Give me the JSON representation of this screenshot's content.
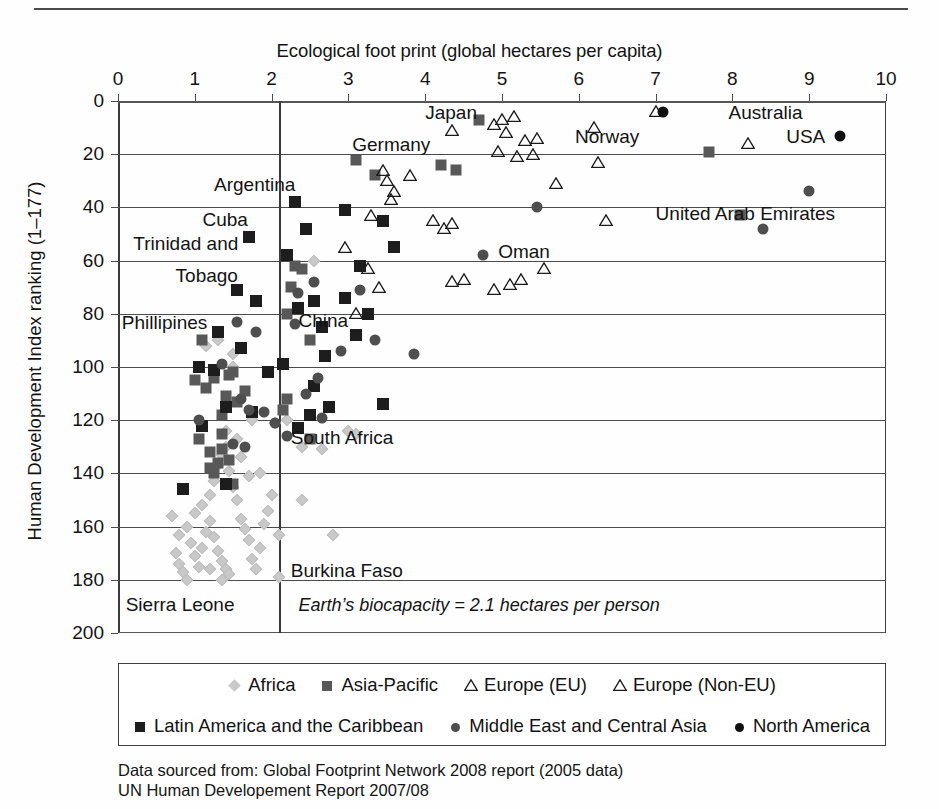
{
  "figure": {
    "top_rule": true,
    "source_lines": [
      "Data sourced from: Global Footprint Network 2008 report (2005 data)",
      "UN Human Developement Report 2007/08"
    ],
    "source_line_1": "Data sourced from: Global Footprint Network 2008 report (2005 data)",
    "source_line_2": "UN Human Developement Report 2007/08"
  },
  "chart_data": {
    "type": "scatter",
    "title": "",
    "xlabel": "Ecological foot print (global hectares per capita)",
    "ylabel": "Human Development Index ranking (1–177)",
    "xlim": [
      0,
      10
    ],
    "ylim": [
      0,
      200
    ],
    "xticks": [
      0,
      1,
      2,
      3,
      4,
      5,
      6,
      7,
      8,
      9,
      10
    ],
    "yticks": [
      0,
      20,
      40,
      60,
      80,
      100,
      120,
      140,
      160,
      180,
      200
    ],
    "y_inverted": true,
    "grid": "horizontal",
    "legend_position": "below-plot",
    "annotation_line": {
      "type": "vertical",
      "x": 2.1,
      "label": "Earth’s biocapacity = 2.1 hectares per person",
      "label_x": 2.35,
      "label_y": 190
    },
    "series": [
      {
        "name": "Africa",
        "marker": "diamond",
        "color": "#c9c9c9",
        "points": [
          [
            0.7,
            156
          ],
          [
            0.8,
            163
          ],
          [
            0.75,
            170
          ],
          [
            0.8,
            174
          ],
          [
            0.85,
            177
          ],
          [
            0.9,
            160
          ],
          [
            0.95,
            166
          ],
          [
            1.0,
            171
          ],
          [
            1.05,
            175
          ],
          [
            1.1,
            168
          ],
          [
            1.15,
            162
          ],
          [
            1.2,
            158
          ],
          [
            1.25,
            164
          ],
          [
            1.3,
            169
          ],
          [
            1.35,
            173
          ],
          [
            1.4,
            176
          ],
          [
            1.45,
            178
          ],
          [
            1.0,
            155
          ],
          [
            1.1,
            152
          ],
          [
            1.2,
            148
          ],
          [
            1.25,
            143
          ],
          [
            1.3,
            137
          ],
          [
            1.35,
            133
          ],
          [
            1.4,
            130
          ],
          [
            1.45,
            139
          ],
          [
            1.5,
            145
          ],
          [
            1.55,
            150
          ],
          [
            1.6,
            157
          ],
          [
            1.65,
            161
          ],
          [
            1.7,
            165
          ],
          [
            1.75,
            172
          ],
          [
            1.8,
            176
          ],
          [
            1.85,
            168
          ],
          [
            1.9,
            159
          ],
          [
            1.95,
            154
          ],
          [
            1.4,
            124
          ],
          [
            1.55,
            127
          ],
          [
            1.6,
            134
          ],
          [
            1.7,
            141
          ],
          [
            1.15,
            92
          ],
          [
            1.85,
            140
          ],
          [
            2.0,
            148
          ],
          [
            2.1,
            163
          ],
          [
            2.1,
            179
          ],
          [
            2.4,
            130
          ],
          [
            2.4,
            150
          ],
          [
            2.65,
            131
          ],
          [
            2.8,
            163
          ],
          [
            2.05,
            121
          ],
          [
            1.5,
            95
          ],
          [
            3.0,
            124
          ],
          [
            3.1,
            125
          ],
          [
            2.55,
            60
          ],
          [
            1.3,
            90
          ],
          [
            1.5,
            100
          ],
          [
            1.2,
            176
          ],
          [
            1.35,
            180
          ],
          [
            0.9,
            180
          ],
          [
            2.2,
            120
          ],
          [
            1.75,
            120
          ]
        ]
      },
      {
        "name": "Asia-Pacific",
        "marker": "square",
        "color": "#585858",
        "points": [
          [
            2.2,
            80
          ],
          [
            2.3,
            62
          ],
          [
            2.25,
            70
          ],
          [
            2.5,
            90
          ],
          [
            2.2,
            112
          ],
          [
            1.55,
            113
          ],
          [
            1.35,
            118
          ],
          [
            1.1,
            90
          ],
          [
            1.25,
            104
          ],
          [
            1.45,
            103
          ],
          [
            1.0,
            105
          ],
          [
            1.15,
            108
          ],
          [
            1.4,
            111
          ],
          [
            2.15,
            116
          ],
          [
            1.3,
            136
          ],
          [
            1.2,
            132
          ],
          [
            1.35,
            131
          ],
          [
            1.45,
            135
          ],
          [
            1.25,
            140
          ],
          [
            1.5,
            144
          ],
          [
            2.5,
            127
          ],
          [
            4.2,
            24
          ],
          [
            4.7,
            7
          ],
          [
            4.4,
            26
          ],
          [
            3.1,
            22
          ],
          [
            3.35,
            28
          ],
          [
            7.7,
            19
          ],
          [
            8.1,
            43
          ],
          [
            1.5,
            102
          ],
          [
            1.05,
            127
          ],
          [
            2.4,
            63
          ],
          [
            1.65,
            109
          ],
          [
            1.35,
            125
          ],
          [
            1.2,
            138
          ]
        ]
      },
      {
        "name": "Europe (EU)",
        "marker": "triangle",
        "color": "#1a1a1a",
        "points": [
          [
            4.9,
            8
          ],
          [
            5.0,
            6
          ],
          [
            5.15,
            5
          ],
          [
            5.05,
            11
          ],
          [
            5.3,
            14
          ],
          [
            5.2,
            20
          ],
          [
            5.4,
            19
          ],
          [
            4.95,
            18
          ],
          [
            3.45,
            25
          ],
          [
            3.5,
            29
          ],
          [
            3.55,
            36
          ],
          [
            3.6,
            33
          ],
          [
            3.3,
            42
          ],
          [
            3.8,
            27
          ],
          [
            4.1,
            44
          ],
          [
            4.35,
            45
          ],
          [
            4.25,
            47
          ],
          [
            4.5,
            66
          ],
          [
            4.35,
            67
          ],
          [
            2.95,
            54
          ],
          [
            3.25,
            62
          ],
          [
            3.4,
            69
          ],
          [
            5.55,
            62
          ],
          [
            3.1,
            79
          ],
          [
            4.9,
            70
          ]
        ]
      },
      {
        "name": "Europe (Non-EU)",
        "marker": "triangle",
        "color": "#1a1a1a",
        "points": [
          [
            4.35,
            10
          ],
          [
            6.2,
            9
          ],
          [
            5.45,
            13
          ],
          [
            6.25,
            22
          ],
          [
            7.0,
            3
          ],
          [
            5.7,
            30
          ],
          [
            6.35,
            44
          ],
          [
            8.2,
            15
          ],
          [
            5.1,
            68
          ],
          [
            5.25,
            66
          ]
        ]
      },
      {
        "name": "Latin America and the Caribbean",
        "marker": "square",
        "color": "#1d1d1d",
        "points": [
          [
            2.3,
            38
          ],
          [
            2.45,
            48
          ],
          [
            1.7,
            51
          ],
          [
            2.2,
            58
          ],
          [
            2.95,
            41
          ],
          [
            1.55,
            71
          ],
          [
            3.45,
            45
          ],
          [
            2.55,
            75
          ],
          [
            3.15,
            62
          ],
          [
            1.8,
            75
          ],
          [
            2.65,
            85
          ],
          [
            2.35,
            78
          ],
          [
            2.7,
            96
          ],
          [
            1.05,
            100
          ],
          [
            1.25,
            101
          ],
          [
            1.95,
            102
          ],
          [
            1.3,
            87
          ],
          [
            1.6,
            93
          ],
          [
            2.15,
            99
          ],
          [
            2.35,
            123
          ],
          [
            1.1,
            122
          ],
          [
            2.75,
            115
          ],
          [
            3.1,
            88
          ],
          [
            3.6,
            55
          ],
          [
            3.25,
            80
          ],
          [
            2.55,
            107
          ],
          [
            1.4,
            115
          ],
          [
            1.75,
            117
          ],
          [
            0.85,
            146
          ],
          [
            1.4,
            144
          ],
          [
            3.45,
            114
          ],
          [
            2.95,
            74
          ],
          [
            2.5,
            118
          ]
        ]
      },
      {
        "name": "Middle East and Central Asia",
        "marker": "circle",
        "color": "#4e4e4e",
        "points": [
          [
            4.75,
            58
          ],
          [
            3.15,
            71
          ],
          [
            2.55,
            68
          ],
          [
            2.35,
            72
          ],
          [
            2.9,
            94
          ],
          [
            2.6,
            104
          ],
          [
            1.55,
            83
          ],
          [
            1.8,
            87
          ],
          [
            2.3,
            84
          ],
          [
            1.35,
            99
          ],
          [
            1.6,
            112
          ],
          [
            2.65,
            119
          ],
          [
            3.35,
            90
          ],
          [
            2.05,
            121
          ],
          [
            1.9,
            117
          ],
          [
            1.5,
            129
          ],
          [
            3.85,
            95
          ],
          [
            1.05,
            120
          ],
          [
            1.7,
            116
          ],
          [
            9.0,
            34
          ],
          [
            8.4,
            48
          ],
          [
            5.45,
            40
          ],
          [
            2.45,
            110
          ],
          [
            2.2,
            126
          ],
          [
            1.65,
            130
          ]
        ]
      },
      {
        "name": "North America",
        "marker": "circle",
        "color": "#101010",
        "points": [
          [
            7.1,
            4
          ],
          [
            9.4,
            13
          ]
        ]
      }
    ],
    "point_labels": [
      {
        "text": "Japan",
        "x": 4.0,
        "y": 5,
        "anchor": "start"
      },
      {
        "text": "Germany",
        "x": 3.05,
        "y": 17,
        "anchor": "start"
      },
      {
        "text": "Norway",
        "x": 5.95,
        "y": 14,
        "anchor": "start"
      },
      {
        "text": "Australia",
        "x": 7.95,
        "y": 5,
        "anchor": "start"
      },
      {
        "text": "USA",
        "x": 8.7,
        "y": 14,
        "anchor": "start"
      },
      {
        "text": "Argentina",
        "x": 1.25,
        "y": 32,
        "anchor": "start"
      },
      {
        "text": "Cuba",
        "x": 1.1,
        "y": 45,
        "anchor": "start"
      },
      {
        "text": "Trinidad and",
        "x": 0.2,
        "y": 54,
        "anchor": "start"
      },
      {
        "text": "Tobago",
        "x": 0.75,
        "y": 66,
        "anchor": "start"
      },
      {
        "text": "Oman",
        "x": 4.95,
        "y": 57,
        "anchor": "start"
      },
      {
        "text": "United Arab Emirates",
        "x": 7.0,
        "y": 43,
        "anchor": "start"
      },
      {
        "text": "Phillipines",
        "x": 0.05,
        "y": 84,
        "anchor": "start"
      },
      {
        "text": "China",
        "x": 2.35,
        "y": 83,
        "anchor": "start"
      },
      {
        "text": "South Africa",
        "x": 2.25,
        "y": 127,
        "anchor": "start"
      },
      {
        "text": "Burkina Faso",
        "x": 2.25,
        "y": 177,
        "anchor": "start"
      },
      {
        "text": "Sierra Leone",
        "x": 0.1,
        "y": 190,
        "anchor": "start"
      }
    ],
    "legend": {
      "rows": [
        [
          {
            "label": "Africa",
            "marker": "diamond",
            "color": "#c9c9c9"
          },
          {
            "label": "Asia-Pacific",
            "marker": "square",
            "color": "#585858"
          },
          {
            "label": "Europe (EU)",
            "marker": "triangle",
            "color": "#1a1a1a"
          },
          {
            "label": "Europe (Non-EU)",
            "marker": "triangle",
            "color": "#1a1a1a"
          }
        ],
        [
          {
            "label": "Latin America and the Caribbean",
            "marker": "square",
            "color": "#1d1d1d"
          },
          {
            "label": "Middle East and Central Asia",
            "marker": "circle",
            "color": "#4e4e4e"
          },
          {
            "label": "North America",
            "marker": "circle",
            "color": "#101010"
          }
        ]
      ]
    }
  }
}
